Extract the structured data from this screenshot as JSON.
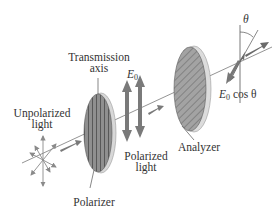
{
  "diagram": {
    "labels": {
      "transmission_axis_line1": "Transmission",
      "transmission_axis_line2": "axis",
      "e0_symbol": "E",
      "e0_subscript": "0",
      "unpolarized_line1": "Unpolarized",
      "unpolarized_line2": "light",
      "polarized_line1": "Polarized",
      "polarized_line2": "light",
      "polarizer": "Polarizer",
      "analyzer": "Analyzer",
      "theta": "θ",
      "output_e": "E",
      "output_sub": "0",
      "output_rest": " cos θ"
    },
    "colors": {
      "arrow": "#7a7a7a",
      "arrow_dark": "#5e5e5e",
      "polarizer_fill": "#8c8c8c",
      "analyzer_fill": "#9a9a9a",
      "edge": "#cfcfcf",
      "line": "#555555",
      "text": "#333333"
    }
  }
}
